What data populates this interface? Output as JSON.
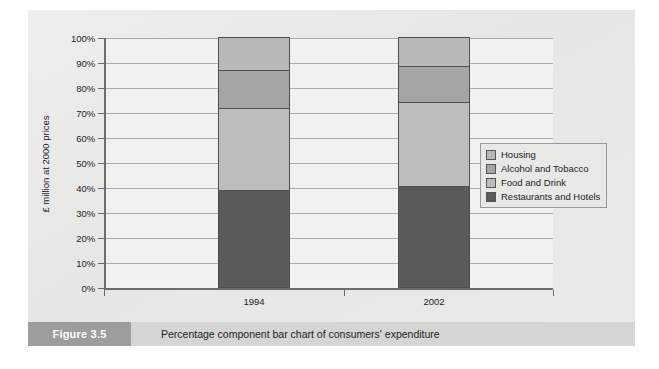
{
  "figure": {
    "caption_number": "Figure 3.5",
    "caption_text": "Percentage component bar chart of consumers' expenditure"
  },
  "chart_data": {
    "type": "bar",
    "stacked": true,
    "normalized": true,
    "title": "",
    "xlabel": "",
    "ylabel": "£ million at 2000 prices",
    "categories": [
      "1994",
      "2002"
    ],
    "ylim": [
      0,
      100
    ],
    "ytick_labels": [
      "0%",
      "10%",
      "20%",
      "30%",
      "40%",
      "50%",
      "60%",
      "70%",
      "80%",
      "90%",
      "100%"
    ],
    "ytick_values": [
      0,
      10,
      20,
      30,
      40,
      50,
      60,
      70,
      80,
      90,
      100
    ],
    "grid": true,
    "legend_position": "right",
    "series": [
      {
        "name": "Housing",
        "color": "#b9b9b9",
        "values": [
          13.0,
          11.5
        ],
        "cumulative_top": [
          100.0,
          100.0
        ]
      },
      {
        "name": "Alcohol and Tobacco",
        "color": "#a5a5a5",
        "values": [
          15.5,
          14.5
        ],
        "cumulative_top": [
          87.0,
          88.5
        ]
      },
      {
        "name": "Food and Drink",
        "color": "#bdbdbd",
        "values": [
          32.5,
          33.5
        ],
        "cumulative_top": [
          71.5,
          74.0
        ]
      },
      {
        "name": "Restaurants and Hotels",
        "color": "#5a5a5a",
        "values": [
          39.0,
          40.5
        ],
        "cumulative_top": [
          39.0,
          40.5
        ]
      }
    ]
  }
}
